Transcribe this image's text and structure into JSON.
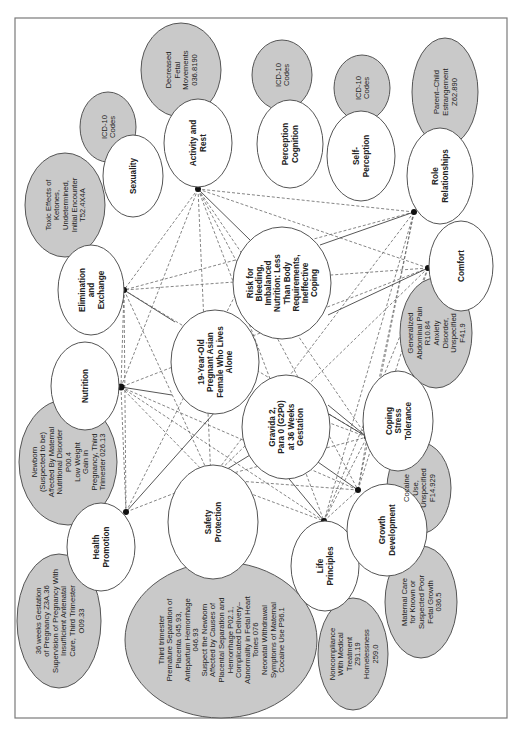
{
  "diagram": {
    "type": "concept-map",
    "orientation": "rotated-90-ccw",
    "center_nodes": {
      "patient": "19-Year-Old Pregnant Asian Female Who Lives Alone",
      "diagnoses": "Risk for Bleeding, Imbalanced Nutrition: Less Than Body Requirements, Ineffective Coping",
      "obstetric": "Gravida 2, Para 0 (G2P0) at 36 Weeks Gestation"
    },
    "domains": [
      {
        "id": "activity",
        "label": "Activity and Rest",
        "codes": "Decreased Fetal Movements 036.8190"
      },
      {
        "id": "sexuality",
        "label": "Sexuality",
        "codes": "ICD-10 Codes"
      },
      {
        "id": "elimination",
        "label": "Elimination and Exchange",
        "codes": "Toxic Effects of Ketones, Undetermined, Initial Encounter T52.4X4A"
      },
      {
        "id": "nutrition",
        "label": "Nutrition",
        "codes": "Newborn (Suspected to be) Affected By Maternal Nutritional Disorder P00.4 Low Weight Gain in Pregnancy, Third Trimester 026.13"
      },
      {
        "id": "health",
        "label": "Health Promotion",
        "codes": "36 weeks Gestation of Pregnancy Z3A.36 Supervision of Pregnancy With Insufficient Antenatal Care, Third Trimester O09.33"
      },
      {
        "id": "safety",
        "label": "Safety Protection",
        "codes": "Third trimester Premature Separation of Placenta 045.93, Antepartum Hemorrhage 046.93 Suspect the Newborn Affected by Causes of Placental Separation and Hemorrhage P02.1, Complicated Delivery–Abnormality in Fetal Heart Tones 076 Neonatal Withdrawal Symptoms of Maternal Cocaine Use P96.1"
      },
      {
        "id": "life",
        "label": "Life Principles",
        "codes": "Noncompliance With Medical Treatment Z91.19 Homelessness 259.0"
      },
      {
        "id": "growth",
        "label": "Growth Development",
        "codes": "Maternal Care for Known or Suspected Poor Fetal Growth 036.5"
      },
      {
        "id": "coping",
        "label": "Coping Stress Tolerance",
        "codes": "Cocaine Use, Unspecified F14.929"
      },
      {
        "id": "comfort",
        "label": "Comfort",
        "codes": "Generalized Abdominal Pain R10.84 Anxiety Disorder, Unspecified F41.9"
      },
      {
        "id": "role",
        "label": "Role Relationships",
        "codes": "Parent–Child Estrangement Z62.890"
      },
      {
        "id": "selfperc",
        "label": "Self-Perception",
        "codes": "ICD-10 Codes"
      },
      {
        "id": "perception",
        "label": "Perception Cognition",
        "codes": "ICD-10 Codes"
      }
    ],
    "labels": {
      "patient": [
        "19-Year-Old",
        "Pregnant Asian",
        "Female Who Lives",
        "Alone"
      ],
      "diagnoses": [
        "Risk for",
        "Bleeding,",
        "Imbalanced",
        "Nutrition: Less",
        "Than Body",
        "Requirements,",
        "Ineffective",
        "Coping"
      ],
      "obstetric": [
        "Gravida 2,",
        "Para 0 (G2P0)",
        "at 36 Weeks",
        "Gestation"
      ],
      "activity": [
        "Activity and",
        "Rest"
      ],
      "activity_codes": [
        "Decreased",
        "Fetal",
        "Movements",
        "036.8190"
      ],
      "sexuality": [
        "Sexuality"
      ],
      "sexuality_codes": [
        "ICD-10",
        "Codes"
      ],
      "elimination": [
        "Elimination",
        "and",
        "Exchange"
      ],
      "elimination_codes": [
        "Toxic Effects of",
        "Ketones,",
        "Undetermined,",
        "Initial Encounter",
        "T52.4X4A"
      ],
      "nutrition": [
        "Nutrition"
      ],
      "nutrition_codes": [
        "Newborn",
        "(Suspected to be)",
        "Affected By Maternal",
        "Nutritional Disorder",
        "P00.4",
        "Low Weight",
        "Gain in",
        "Pregnancy, Third",
        "Trimester 026.13"
      ],
      "health": [
        "Health",
        "Promotion"
      ],
      "health_codes": [
        "36 weeks Gestation",
        "of Pregnancy Z3A.36",
        "Supervision of Pregnancy With",
        "Insufficient Antenatal",
        "Care, Third Trimester",
        "O09.33"
      ],
      "safety": [
        "Safety",
        "Protection"
      ],
      "safety_codes": [
        "Third trimester",
        "Premature Separation of",
        "Placenta 045.93,",
        "Antepartum Hemorrhage",
        "046.93",
        "Suspect the Newborn",
        "Affected by Causes of",
        "Placental Separation and",
        "Hemorrhage P02.1,",
        "Complicated Delivery–",
        "Abnormality in Fetal Heart",
        "Tones 076",
        "Neonatal Withdrawal",
        "Symptoms of Maternal",
        "Cocaine Use P96.1"
      ],
      "life": [
        "Life",
        "Principles"
      ],
      "life_codes": [
        "Noncompliance",
        "With Medical",
        "Treatment",
        "Z91.19",
        "Homelessness",
        "259.0"
      ],
      "growth": [
        "Growth",
        "Development"
      ],
      "growth_codes": [
        "Maternal Care",
        "for Known or",
        "Suspected Poor",
        "Fetal Growth",
        "036.5"
      ],
      "coping": [
        "Coping",
        "Stress",
        "Tolerance"
      ],
      "coping_codes": [
        "Cocaine",
        "Use,",
        "Unspecified",
        "F14.929"
      ],
      "comfort": [
        "Comfort"
      ],
      "comfort_codes": [
        "Generalized",
        "Abdominal Pain",
        "R10.84",
        "Anxiety",
        "Disorder,",
        "Unspecified",
        "F41.9"
      ],
      "role": [
        "Role",
        "Relationships"
      ],
      "role_codes": [
        "Parent–Child",
        "Estrangement",
        "Z62.890"
      ],
      "selfperc": [
        "Self-",
        "Perception"
      ],
      "selfperc_codes": [
        "ICD-10",
        "Codes"
      ],
      "perception": [
        "Perception",
        "Cognition"
      ],
      "perception_codes": [
        "ICD-10",
        "Codes"
      ]
    },
    "colors": {
      "code_fill": "#c9c9c9",
      "node_fill": "#ffffff",
      "stroke": "#555555"
    }
  }
}
